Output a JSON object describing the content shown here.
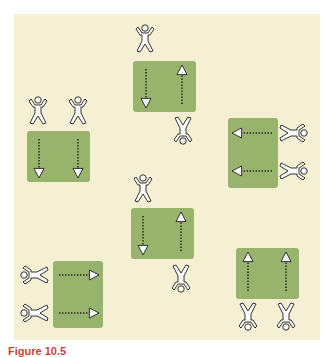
{
  "figure": {
    "caption": "Figure 10.5",
    "colors": {
      "background": "#f5efd4",
      "field": "#98b46c",
      "outline": "#333333",
      "caption": "#c7463a"
    },
    "groups": [
      {
        "name": "top-center",
        "box": {
          "x": 133,
          "y": 61,
          "w": 63,
          "h": 51
        },
        "arrows": [
          {
            "dir": "down",
            "x": 146
          },
          {
            "dir": "up",
            "x": 182
          }
        ],
        "players": [
          {
            "x": 145,
            "y": 38,
            "rot": 0
          },
          {
            "x": 183,
            "y": 131,
            "rot": 180
          }
        ]
      },
      {
        "name": "left",
        "box": {
          "x": 27,
          "y": 131,
          "w": 63,
          "h": 51
        },
        "arrows": [
          {
            "dir": "down",
            "x": 39
          },
          {
            "dir": "down",
            "x": 78
          }
        ],
        "players": [
          {
            "x": 38,
            "y": 110,
            "rot": 0
          },
          {
            "x": 78,
            "y": 110,
            "rot": 0
          }
        ]
      },
      {
        "name": "right-middle",
        "box": {
          "x": 228,
          "y": 118,
          "w": 50,
          "h": 70
        },
        "arrows": [
          {
            "dir": "left",
            "y": 133
          },
          {
            "dir": "left",
            "y": 171
          }
        ],
        "players": [
          {
            "x": 294,
            "y": 133,
            "rot": 90
          },
          {
            "x": 294,
            "y": 171,
            "rot": 90
          }
        ]
      },
      {
        "name": "center",
        "box": {
          "x": 131,
          "y": 208,
          "w": 63,
          "h": 51
        },
        "arrows": [
          {
            "dir": "down",
            "x": 143
          },
          {
            "dir": "up",
            "x": 181
          }
        ],
        "players": [
          {
            "x": 143,
            "y": 188,
            "rot": 0
          },
          {
            "x": 181,
            "y": 279,
            "rot": 180
          }
        ]
      },
      {
        "name": "bottom-left",
        "box": {
          "x": 53,
          "y": 261,
          "w": 50,
          "h": 67
        },
        "arrows": [
          {
            "dir": "right",
            "y": 275
          },
          {
            "dir": "right",
            "y": 313
          }
        ],
        "players": [
          {
            "x": 34,
            "y": 275,
            "rot": -90
          },
          {
            "x": 34,
            "y": 313,
            "rot": -90
          }
        ]
      },
      {
        "name": "bottom-right",
        "box": {
          "x": 236,
          "y": 248,
          "w": 63,
          "h": 51
        },
        "arrows": [
          {
            "dir": "up",
            "x": 248
          },
          {
            "dir": "up",
            "x": 286
          }
        ],
        "players": [
          {
            "x": 248,
            "y": 317,
            "rot": 180
          },
          {
            "x": 286,
            "y": 317,
            "rot": 180
          }
        ]
      }
    ]
  }
}
